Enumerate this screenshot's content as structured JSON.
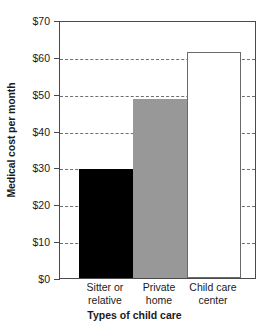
{
  "chart_data": {
    "type": "bar",
    "title": "",
    "xlabel": "Types of child care",
    "ylabel": "Medical cost per month",
    "categories": [
      "Sitter or relative",
      "Private home",
      "Child care center"
    ],
    "category_lines": [
      [
        "Sitter or",
        "relative"
      ],
      [
        "Private",
        "home"
      ],
      [
        "Child care",
        "center"
      ]
    ],
    "values": [
      29.5,
      48.7,
      61.3
    ],
    "value_labels": [
      "$29.50",
      "$48.70",
      "$61.30"
    ],
    "bar_colors": [
      "#000000",
      "#989898",
      "#ffffff"
    ],
    "ylim": [
      0,
      70
    ],
    "yticks": [
      0,
      10,
      20,
      30,
      40,
      50,
      60,
      70
    ],
    "ytick_labels": [
      "$0",
      "$10",
      "$20",
      "$30",
      "$40",
      "$50",
      "$60",
      "$70"
    ],
    "grid": true,
    "grid_axis": "y",
    "grid_style": "dashed",
    "legend": false,
    "legend_position": "none",
    "frame": true,
    "frame_color": "#4a4a4a",
    "background": "#ffffff"
  }
}
